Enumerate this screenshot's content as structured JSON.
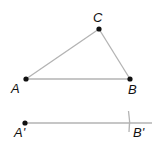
{
  "diagram": {
    "type": "geometric-construction",
    "colors": {
      "line": "#b3b3b3",
      "point": "#111111",
      "label": "#111111"
    },
    "triangle": {
      "points": {
        "A": {
          "label": "A",
          "x": 26,
          "y": 79
        },
        "B": {
          "label": "B",
          "x": 130,
          "y": 79
        },
        "C": {
          "label": "C",
          "x": 99,
          "y": 29
        }
      },
      "segments": [
        "AB",
        "BC",
        "CA"
      ]
    },
    "construction": {
      "ray_start": {
        "label": "A'",
        "x": 25,
        "y": 123
      },
      "ray_end_x": 152,
      "arc_mark": {
        "label": "B'",
        "x": 129,
        "y": 123
      }
    }
  }
}
